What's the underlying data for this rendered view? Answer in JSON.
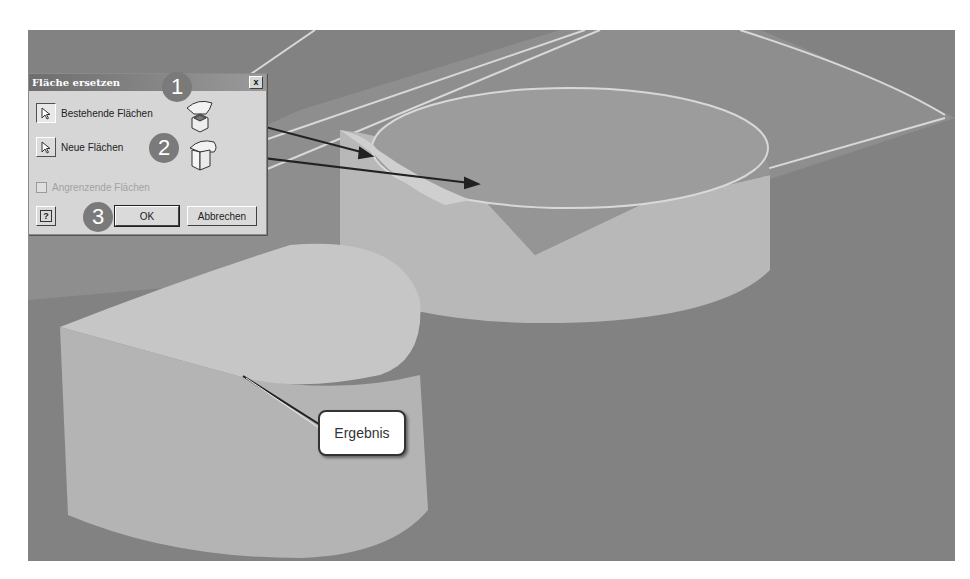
{
  "dialog": {
    "title": "Fläche ersetzen",
    "close_label": "x",
    "existing_faces_label": "Bestehende Flächen",
    "new_faces_label": "Neue Flächen",
    "adjacent_faces_label": "Angrenzende Flächen",
    "adjacent_faces_checked": false,
    "help_label": "?",
    "ok_label": "OK",
    "cancel_label": "Abbrechen"
  },
  "annotations": {
    "step1": "1",
    "step2": "2",
    "step3": "3",
    "result_label": "Ergebnis"
  },
  "viewport": {
    "background": "#828282",
    "part_color": "#bdbdbd",
    "surface_color": "#9a9a9a",
    "edge_color": "#d8d8d8"
  }
}
